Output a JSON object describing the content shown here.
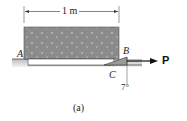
{
  "figure": {
    "dimension_label": "1 m",
    "point_labels": {
      "A": "A",
      "B": "B",
      "C": "C"
    },
    "force_label": "P",
    "angle_label": "7°",
    "caption": "(a)"
  },
  "colors": {
    "block_fill": "#8a8a8a",
    "ground": "#b8b8b8",
    "wedge": "#9a9a9a",
    "line": "#222222"
  }
}
